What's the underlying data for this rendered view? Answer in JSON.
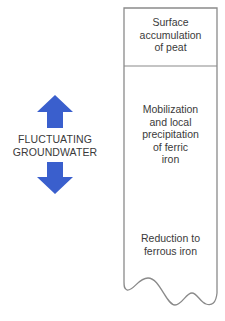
{
  "diagram": {
    "left_label": {
      "line1": "FLUCTUATING",
      "line2": "GROUNDWATER"
    },
    "arrows": {
      "up": "arrow-up",
      "down": "arrow-down",
      "color": "#3a5fcd"
    },
    "column": {
      "zones": [
        {
          "lines": [
            "Surface",
            "accumulation",
            "of peat"
          ]
        },
        {
          "lines": [
            "Mobilization",
            "and local",
            "precipitation",
            "of ferric",
            "iron"
          ]
        },
        {
          "lines": [
            "Reduction to",
            "ferrous iron"
          ]
        }
      ],
      "border_color": "#808080"
    }
  }
}
